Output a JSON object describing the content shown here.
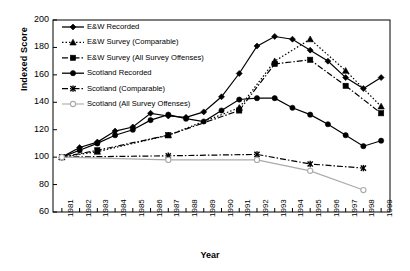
{
  "chart_data": {
    "type": "line",
    "title": "",
    "xlabel": "Year",
    "ylabel": "Indexed Score",
    "x": [
      1981,
      1982,
      1983,
      1984,
      1985,
      1986,
      1987,
      1988,
      1989,
      1990,
      1991,
      1992,
      1993,
      1994,
      1995,
      1996,
      1997,
      1998,
      1999
    ],
    "xtick_labels": [
      "1981",
      "1982",
      "1983",
      "1984",
      "1985",
      "1986",
      "1987",
      "1988",
      "1989",
      "1990",
      "1991",
      "1992",
      "1993",
      "1994",
      "1995",
      "1996",
      "1997",
      "1998",
      "1999"
    ],
    "ytick_labels": [
      "60",
      "80",
      "100",
      "120",
      "140",
      "160",
      "180",
      "200"
    ],
    "ylim": [
      60,
      200
    ],
    "ytick_step": 20,
    "grid": false,
    "legend_position": "top-left-inside",
    "series": [
      {
        "name": "E&W Recorded",
        "marker": "diamond",
        "line_style": "solid",
        "color": "#000000",
        "x": [
          1981,
          1982,
          1983,
          1984,
          1985,
          1986,
          1987,
          1988,
          1989,
          1990,
          1991,
          1992,
          1993,
          1994,
          1995,
          1996,
          1997,
          1998,
          1999
        ],
        "values": [
          100,
          107,
          111,
          119,
          122,
          132,
          130,
          129,
          133,
          144,
          161,
          181,
          188,
          186,
          178,
          170,
          158,
          150,
          158
        ]
      },
      {
        "name": "E&W Survey (Comparable)",
        "marker": "triangle",
        "line_style": "dotted",
        "color": "#000000",
        "x": [
          1981,
          1983,
          1987,
          1991,
          1993,
          1995,
          1997,
          1999
        ],
        "values": [
          100,
          104,
          116,
          136,
          170,
          186,
          163,
          137
        ]
      },
      {
        "name": "E&W Survey (All Survey Offenses)",
        "marker": "square",
        "line_style": "dash-dot",
        "color": "#000000",
        "x": [
          1981,
          1983,
          1987,
          1991,
          1993,
          1995,
          1997,
          1999
        ],
        "values": [
          100,
          105,
          116,
          134,
          168,
          171,
          152,
          132
        ]
      },
      {
        "name": "Scotland Recorded",
        "marker": "circle",
        "line_style": "solid",
        "color": "#000000",
        "x": [
          1981,
          1982,
          1983,
          1984,
          1985,
          1986,
          1987,
          1988,
          1989,
          1990,
          1991,
          1992,
          1993,
          1994,
          1995,
          1996,
          1997,
          1998,
          1999
        ],
        "values": [
          100,
          105,
          110,
          116,
          120,
          127,
          131,
          128,
          126,
          134,
          142,
          143,
          143,
          136,
          131,
          124,
          116,
          108,
          112
        ]
      },
      {
        "name": "Scotland (Comparable)",
        "marker": "x",
        "line_style": "dash-dot",
        "color": "#000000",
        "x": [
          1981,
          1987,
          1992,
          1995,
          1998
        ],
        "values": [
          100,
          101,
          102,
          95,
          92
        ]
      },
      {
        "name": "Scotland (All Survey Offenses)",
        "marker": "open-circle",
        "line_style": "solid",
        "color": "#aaaaaa",
        "x": [
          1981,
          1987,
          1992,
          1995,
          1998
        ],
        "values": [
          100,
          98,
          98,
          90,
          76
        ]
      }
    ],
    "legend": [
      "E&W Recorded",
      "E&W Survey (Comparable)",
      "E&W Survey (All Survey Offenses)",
      "Scotland Recorded",
      "Scotland (Comparable)",
      "Scotland (All Survey Offenses)"
    ]
  }
}
